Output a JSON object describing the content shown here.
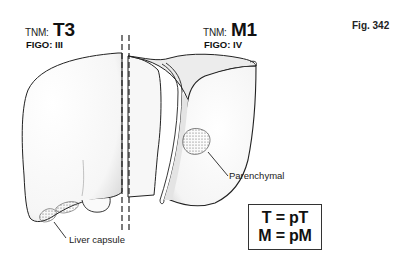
{
  "figure": {
    "number_label": "Fig. 342"
  },
  "left_panel": {
    "tnm_prefix": "TNM:",
    "tnm_stage": "T3",
    "figo": "FIGO: III",
    "callout": "Liver capsule"
  },
  "right_panel": {
    "tnm_prefix": "TNM:",
    "tnm_stage": "M1",
    "figo": "FIGO: IV",
    "callout": "Parenchymal"
  },
  "formula": {
    "line1": "T = pT",
    "line2": "M = pM"
  },
  "colors": {
    "line": "#222222",
    "tumor": "#4a4a4a",
    "shade": "#cfcfcf"
  }
}
